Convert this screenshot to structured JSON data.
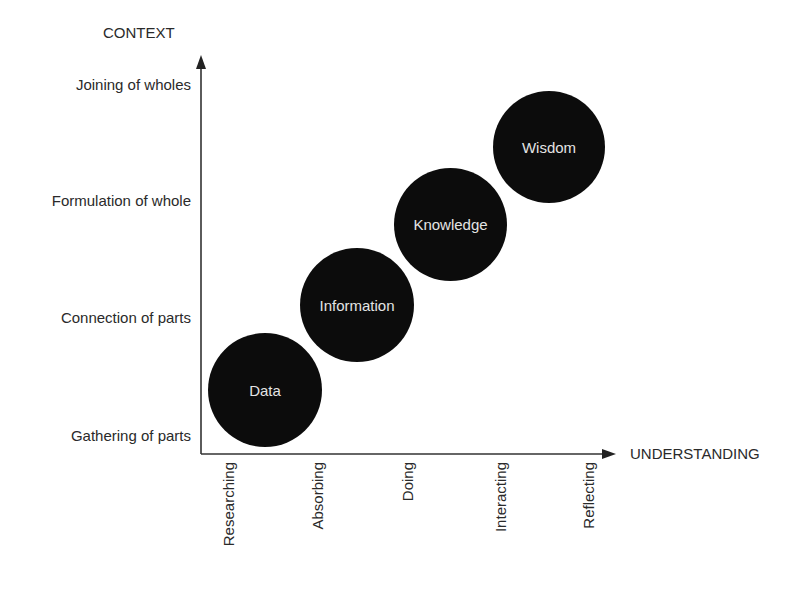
{
  "diagram": {
    "y_axis": {
      "title": "CONTEXT",
      "levels": [
        "Joining of wholes",
        "Formulation of whole",
        "Connection of parts",
        "Gathering of parts"
      ]
    },
    "x_axis": {
      "title": "UNDERSTANDING",
      "levels": [
        "Researching",
        "Absorbing",
        "Doing",
        "Interacting",
        "Reflecting"
      ]
    },
    "stages": [
      {
        "label": "Data",
        "fill": "#0c0c0c"
      },
      {
        "label": "Information",
        "fill": "#0c0c0c"
      },
      {
        "label": "Knowledge",
        "fill": "#0c0c0c"
      },
      {
        "label": "Wisdom",
        "fill": "#0c0c0c"
      }
    ],
    "colors": {
      "axis": "#333333",
      "circle": "#0c0c0c",
      "circle_text": "#e4e4e4",
      "text": "#2a2a2a"
    }
  }
}
